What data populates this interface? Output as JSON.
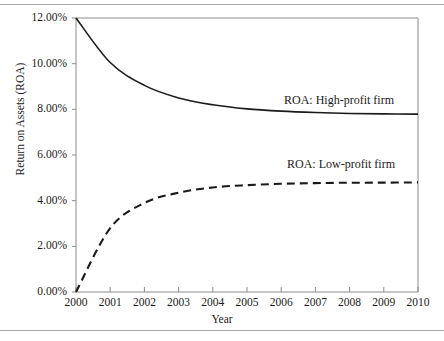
{
  "chart_data": {
    "type": "line",
    "title": "",
    "xlabel": "Year",
    "ylabel": "Return on Assets (ROA)",
    "x": [
      2000,
      2001,
      2002,
      2003,
      2004,
      2005,
      2006,
      2007,
      2008,
      2009,
      2010
    ],
    "xtick_labels": [
      "2000",
      "2001",
      "2002",
      "2003",
      "2004",
      "2005",
      "2006",
      "2007",
      "2008",
      "2009",
      "2010"
    ],
    "ytick_labels": [
      "0.00%",
      "2.00%",
      "4.00%",
      "6.00%",
      "8.00%",
      "10.00%",
      "12.00%"
    ],
    "ytick_values": [
      0,
      2,
      4,
      6,
      8,
      10,
      12
    ],
    "ylim": [
      0,
      12
    ],
    "xlim": [
      2000,
      2010
    ],
    "grid": false,
    "legend_position": "inline-right",
    "series": [
      {
        "name": "ROA: High-profit firm",
        "style": "solid",
        "color": "#1a1a1a",
        "values": [
          12.0,
          10.05,
          9.05,
          8.5,
          8.2,
          8.02,
          7.92,
          7.86,
          7.82,
          7.8,
          7.79
        ]
      },
      {
        "name": "ROA: Low-profit firm",
        "style": "dashed",
        "color": "#1a1a1a",
        "values": [
          0.0,
          2.8,
          3.9,
          4.35,
          4.58,
          4.68,
          4.74,
          4.77,
          4.785,
          4.79,
          4.8
        ]
      }
    ],
    "annotations": [
      {
        "text": "ROA: High-profit firm",
        "series": "ROA: High-profit firm"
      },
      {
        "text": "ROA: Low-profit firm",
        "series": "ROA: Low-profit firm"
      }
    ],
    "axis_color": "#8c8c8c"
  }
}
